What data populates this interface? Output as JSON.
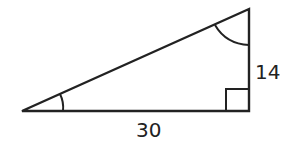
{
  "diagram": {
    "type": "right-triangle",
    "stroke_color": "#222222",
    "labels": {
      "vertical_leg": "14",
      "horizontal_leg": "30"
    },
    "markers": {
      "right_angle": "bottom-right",
      "angle_arcs": [
        "left-vertex",
        "top-vertex"
      ]
    }
  }
}
